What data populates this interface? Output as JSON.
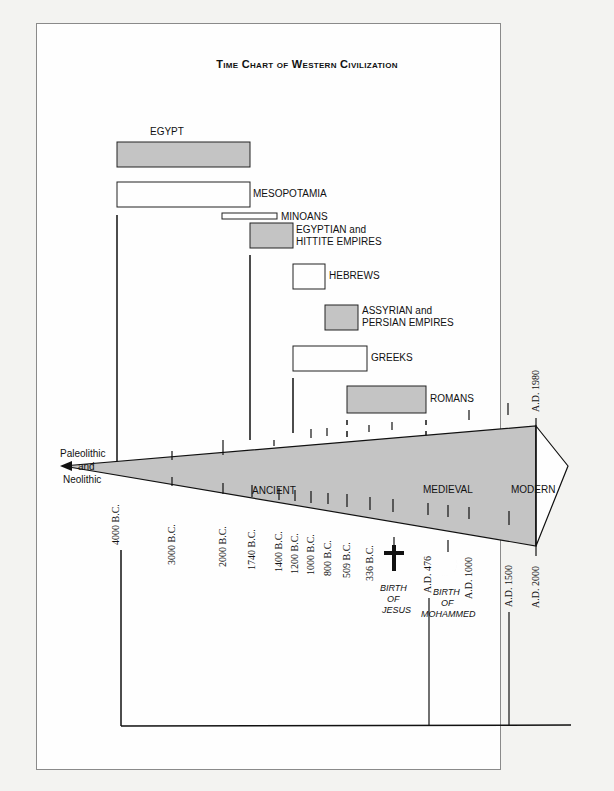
{
  "title": "Time Chart of Western Civilization",
  "colors": {
    "shade": "#c4c4c4",
    "line": "#111111",
    "paper": "#fefefe"
  },
  "civilizations": [
    {
      "name": "EGYPT",
      "shaded": true
    },
    {
      "name": "MESOPOTAMIA",
      "shaded": false
    },
    {
      "name": "MINOANS",
      "shaded": false
    },
    {
      "name": "EGYPTIAN and",
      "name2": "HITTITE EMPIRES",
      "shaded": true
    },
    {
      "name": "HEBREWS",
      "shaded": false
    },
    {
      "name": "ASSYRIAN and",
      "name2": "PERSIAN EMPIRES",
      "shaded": true
    },
    {
      "name": "GREEKS",
      "shaded": false
    },
    {
      "name": "ROMANS",
      "shaded": true
    }
  ],
  "eras": {
    "prehistoric": [
      "Paleolithic",
      "and",
      "Neolithic"
    ],
    "ancient": "ANCIENT",
    "medieval": "MEDIEVAL",
    "modern": "MODERN"
  },
  "dates": {
    "d4000bc": "4000 B.C.",
    "d3000bc": "3000 B.C.",
    "d2000bc": "2000 B.C.",
    "d1740bc": "1740 B.C.",
    "d1400bc": "1400 B.C.",
    "d1200bc": "1200 B.C.",
    "d1000bc": "1000 B.C.",
    "d800bc": "800 B.C.",
    "d509bc": "509 B.C.",
    "d336bc": "336 B.C.",
    "ad476": "A.D. 476",
    "ad1000": "A.D. 1000",
    "ad1500": "A.D. 1500",
    "ad2000": "A.D. 2000",
    "ad1980": "A.D. 1980"
  },
  "events": {
    "jesus": [
      "BIRTH",
      "OF",
      "JESUS"
    ],
    "mohammed": [
      "BIRTH",
      "OF",
      "MOHAMMED"
    ]
  }
}
